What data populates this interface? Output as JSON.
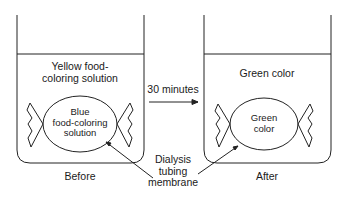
{
  "before": {
    "outer_solution": [
      "Yellow food-",
      "coloring solution"
    ],
    "inner_solution": [
      "Blue",
      "food-coloring",
      "solution"
    ],
    "caption": "Before"
  },
  "after": {
    "outer_solution": "Green color",
    "inner_solution": [
      "Green",
      "color"
    ],
    "caption": "After"
  },
  "arrow_label": "30 minutes",
  "membrane_label": [
    "Dialysis",
    "tubing",
    "membrane"
  ]
}
